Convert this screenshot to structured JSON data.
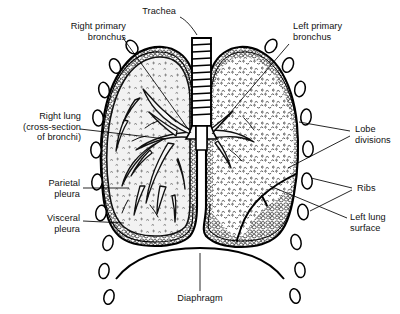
{
  "figure": {
    "background_color": "#ffffff",
    "ink_color": "#000000",
    "width": 400,
    "height": 314
  },
  "labels": {
    "trachea": "Trachea",
    "right_primary_bronchus": "Right primary\nbronchus",
    "left_primary_bronchus": "Left primary\nbronchus",
    "right_lung": "Right lung\n(cross-section\nof bronchi)",
    "parietal_pleura": "Parietal\npleura",
    "visceral_pleura": "Visceral\npleura",
    "lobe_divisions": "Lobe\ndivisions",
    "ribs": "Ribs",
    "left_lung_surface": "Left lung\nsurface",
    "diaphragm": "Diaphragm"
  },
  "structures": {
    "trachea_rings": 11,
    "ribs_left_count": 8,
    "ribs_right_count": 8,
    "lobes_right": 3,
    "lobes_left": 2
  }
}
